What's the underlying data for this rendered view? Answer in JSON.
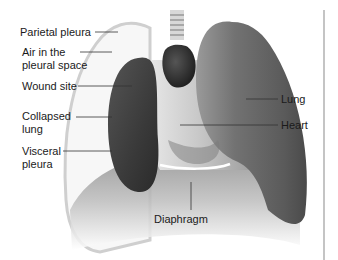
{
  "diagram": {
    "labels": {
      "parietal_pleura": "Parietal pleura",
      "air_pleural_space_1": "Air in the",
      "air_pleural_space_2": "pleural space",
      "wound_site": "Wound site",
      "collapsed_lung_1": "Collapsed",
      "collapsed_lung_2": "lung",
      "visceral_pleura_1": "Visceral",
      "visceral_pleura_2": "pleura",
      "lung": "Lung",
      "heart": "Heart",
      "diaphragm": "Diaphragm"
    },
    "colors": {
      "background": "#ffffff",
      "text": "#1a1a1a",
      "leader_line": "#333333",
      "collapsed_lung": "#3e3e3e",
      "healthy_lung": "#6a6a6a",
      "heart": "#2a2a2a",
      "pleural_outline": "#cfcfcf",
      "frame_edge": "#c4c4c4"
    }
  }
}
